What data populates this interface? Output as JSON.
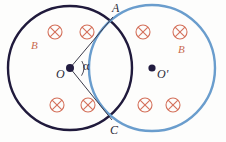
{
  "figure": {
    "background_color": "#fdfdfc",
    "circles": [
      {
        "name": "left-circle",
        "label": "B",
        "center_label": "O",
        "cx": 70,
        "cy": 68,
        "r": 62,
        "stroke": "#201a3c",
        "stroke_width": 2.4,
        "field_label_x": 31,
        "field_label_y": 40
      },
      {
        "name": "right-circle",
        "label": "B",
        "center_label": "O'",
        "cx": 152,
        "cy": 68,
        "r": 63,
        "stroke": "#6a9dcd",
        "stroke_width": 2.4,
        "field_label_x": 178,
        "field_label_y": 44
      }
    ],
    "points": [
      {
        "name": "point-A",
        "label": "A",
        "x": 113,
        "y": 17
      },
      {
        "name": "point-C",
        "label": "C",
        "x": 112,
        "y": 120
      },
      {
        "name": "center-O",
        "label": "O",
        "x": 70,
        "y": 68
      },
      {
        "name": "center-O-prime",
        "label": "O'",
        "x": 152,
        "y": 68
      }
    ],
    "angle": {
      "name": "angle-alpha",
      "label": "α",
      "vertex_x": 70,
      "vertex_y": 68,
      "arc_radius": 14
    },
    "radius_lines": [
      {
        "name": "radius-line-OA",
        "x1": 70,
        "y1": 68,
        "x2": 113,
        "y2": 17
      },
      {
        "name": "radius-line-OC",
        "x1": 70,
        "y1": 68,
        "x2": 112,
        "y2": 120
      }
    ],
    "field_symbols": {
      "glyph_name": "field-into-page-icon",
      "color": "#d4705a",
      "radius": 7,
      "positions": [
        {
          "name": "field-symbol-left-top-1",
          "x": 55,
          "y": 32
        },
        {
          "name": "field-symbol-left-top-2",
          "x": 87,
          "y": 32
        },
        {
          "name": "field-symbol-left-bottom-1",
          "x": 57,
          "y": 105
        },
        {
          "name": "field-symbol-left-bottom-2",
          "x": 88,
          "y": 105
        },
        {
          "name": "field-symbol-right-top-1",
          "x": 143,
          "y": 32
        },
        {
          "name": "field-symbol-right-top-2",
          "x": 180,
          "y": 32
        },
        {
          "name": "field-symbol-right-bottom-1",
          "x": 145,
          "y": 105
        },
        {
          "name": "field-symbol-right-bottom-2",
          "x": 173,
          "y": 105
        }
      ]
    },
    "colors": {
      "left_circle_stroke": "#201a3c",
      "right_circle_stroke": "#6a9dcd",
      "field_symbol": "#d4705a",
      "field_label": "#c96a4f",
      "point_label": "#2a2a38",
      "line": "#3a3a4a"
    }
  }
}
